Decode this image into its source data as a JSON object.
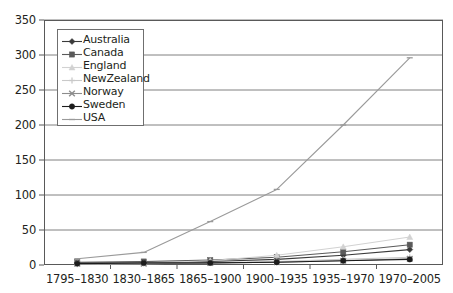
{
  "chart_data": {
    "type": "line",
    "title": "",
    "subtitle": "",
    "xlabel": "",
    "ylabel": "",
    "categories": [
      "1795–1830",
      "1830–1865",
      "1865–1900",
      "1900–1935",
      "1935–1970",
      "1970–2005"
    ],
    "ylim": [
      0,
      350
    ],
    "yticks": [
      0,
      50,
      100,
      150,
      200,
      250,
      300,
      350
    ],
    "ytick_labels": [
      "0",
      "50",
      "100",
      "150",
      "200",
      "250",
      "300",
      "350"
    ],
    "grid": true,
    "grid_axis": "y",
    "legend_position": "upper-left-inside",
    "series": [
      {
        "name": "Australia",
        "marker": "diamond",
        "color": "#3a3a3a",
        "values": [
          3,
          4,
          5,
          8,
          14,
          22
        ]
      },
      {
        "name": "Canada",
        "marker": "square",
        "color": "#5a5a5a",
        "values": [
          4,
          5,
          7,
          11,
          19,
          29
        ]
      },
      {
        "name": "England",
        "marker": "triangle",
        "color": "#d2d2d2",
        "values": [
          2,
          3,
          6,
          14,
          26,
          40
        ]
      },
      {
        "name": "NewZealand",
        "marker": "cross",
        "color": "#c9c9c9",
        "values": [
          1,
          2,
          3,
          5,
          8,
          11
        ]
      },
      {
        "name": "Norway",
        "marker": "x",
        "color": "#8c8c8c",
        "values": [
          2,
          2,
          3,
          4,
          6,
          9
        ]
      },
      {
        "name": "Sweden",
        "marker": "circle",
        "color": "#1c1c1c",
        "values": [
          2,
          3,
          3,
          4,
          6,
          8
        ]
      },
      {
        "name": "USA",
        "marker": "line",
        "color": "#9a9a9a",
        "values": [
          9,
          18,
          62,
          108,
          200,
          296
        ]
      }
    ]
  },
  "axis": {
    "frame_color": "#595959",
    "grid_color": "#808080",
    "tick_color": "#595959"
  }
}
